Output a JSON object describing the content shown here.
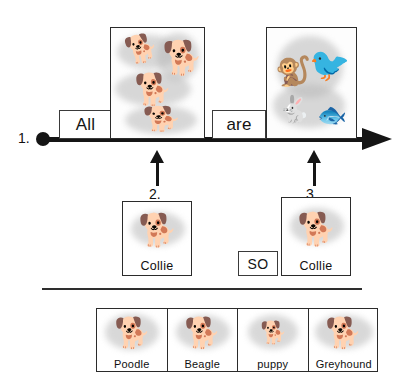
{
  "figure": {
    "ink_color": "#151515",
    "box_border_color": "#2b2b2b",
    "background": "#ffffff"
  },
  "axis": {
    "step_number": "1.",
    "start_marker": "filled-dot",
    "end_marker": "arrowhead-right"
  },
  "sentence": {
    "word_1": "All",
    "word_2": "are"
  },
  "callouts": [
    {
      "number": "2.",
      "points_to": "premise-panel"
    },
    {
      "number": "3.",
      "points_to": "conclusion-panel"
    }
  ],
  "panels": [
    {
      "id": "panel-dogs",
      "creatures": [
        {
          "name": "terrier-running",
          "glyph": "🐕"
        },
        {
          "name": "husky-sitting",
          "glyph": "🐕"
        },
        {
          "name": "hound-standing",
          "glyph": "🐕"
        },
        {
          "name": "dachshund",
          "glyph": "🐕"
        }
      ]
    },
    {
      "id": "panel-animals",
      "creatures": [
        {
          "name": "monkey",
          "glyph": "🐒"
        },
        {
          "name": "stork",
          "glyph": "🐦"
        },
        {
          "name": "rabbit",
          "glyph": "🐇"
        },
        {
          "name": "fish",
          "glyph": "🐟"
        }
      ]
    }
  ],
  "terms": {
    "premise_card": {
      "label": "Collie",
      "art": "collie-dog"
    },
    "connector": {
      "label": "SO"
    },
    "conclusion_card": {
      "label": "Collie",
      "art": "collie-dog"
    }
  },
  "breed_strip": {
    "cells": [
      {
        "label": "Poodle",
        "art": "poodle"
      },
      {
        "label": "Beagle",
        "art": "beagle"
      },
      {
        "label": "puppy",
        "art": "puppy"
      },
      {
        "label": "Greyhound",
        "art": "greyhound"
      }
    ]
  }
}
